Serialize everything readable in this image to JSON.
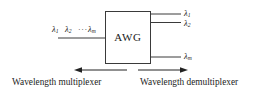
{
  "figure": {
    "device_label": "AWG",
    "line_color": "#3a3a3a",
    "text_color": "#1c1c1c",
    "background": "#ffffff"
  },
  "input_port": {
    "lambda_symbol": "λ",
    "labels": [
      {
        "symbol": "λ",
        "subscript": "1"
      },
      {
        "symbol": "λ",
        "subscript": "2"
      },
      {
        "symbol": "λ",
        "subscript": "m"
      }
    ],
    "ellipsis": "···"
  },
  "output_ports": {
    "labels": [
      {
        "symbol": "λ",
        "subscript": "1"
      },
      {
        "symbol": "λ",
        "subscript": "2"
      },
      {
        "symbol": "λ",
        "subscript": "m"
      }
    ]
  },
  "captions": {
    "left": "Wavelength multiplexer",
    "right": "Wavelength demultiplexer"
  },
  "arrows": {
    "left_direction": "left",
    "right_direction": "right"
  }
}
